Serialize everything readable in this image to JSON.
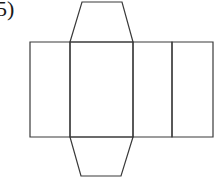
{
  "problem": {
    "label": "5)"
  },
  "figure": {
    "stroke_color": "#3a3a3a",
    "background_color": "#ffffff",
    "faces": [
      {
        "name": "face-1",
        "shape": "rectangle",
        "points": [
          [
            30,
            42
          ],
          [
            70,
            42
          ],
          [
            70,
            137
          ],
          [
            30,
            137
          ]
        ]
      },
      {
        "name": "face-2",
        "shape": "rectangle",
        "points": [
          [
            70,
            42
          ],
          [
            133,
            42
          ],
          [
            133,
            137
          ],
          [
            70,
            137
          ]
        ]
      },
      {
        "name": "face-3",
        "shape": "rectangle",
        "points": [
          [
            133,
            42
          ],
          [
            172,
            42
          ],
          [
            172,
            137
          ],
          [
            133,
            137
          ]
        ]
      },
      {
        "name": "face-4",
        "shape": "rectangle",
        "points": [
          [
            172,
            42
          ],
          [
            213,
            42
          ],
          [
            213,
            137
          ],
          [
            172,
            137
          ]
        ]
      },
      {
        "name": "top-flap",
        "shape": "trapezoid",
        "points": [
          [
            70,
            42
          ],
          [
            82,
            2
          ],
          [
            122,
            2
          ],
          [
            133,
            42
          ]
        ]
      },
      {
        "name": "bottom-flap",
        "shape": "trapezoid",
        "points": [
          [
            70,
            137
          ],
          [
            81,
            176
          ],
          [
            121,
            176
          ],
          [
            133,
            137
          ]
        ]
      }
    ]
  }
}
